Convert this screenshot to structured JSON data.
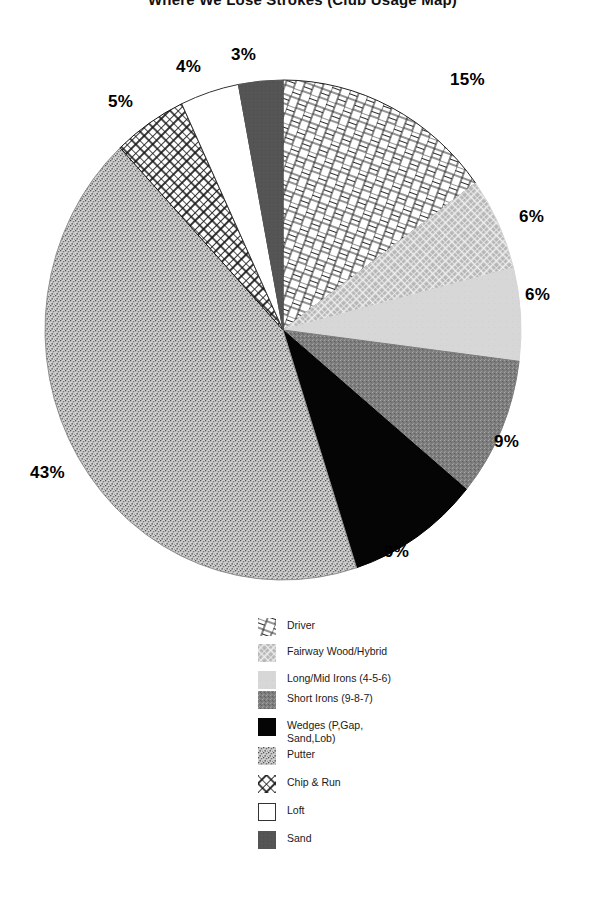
{
  "chart_data": {
    "type": "pie",
    "title": "Where We Lose Strokes (Club Usage Map)",
    "labels": [
      "Driver",
      "Fairway Wood/Hybrid",
      "Long/Mid Irons (4-5-6)",
      "Short Irons (9-8-7)",
      "Wedges (P,Gap, Sand,Lob)",
      "Putter",
      "Chip & Run",
      "Loft",
      "Sand"
    ],
    "values": [
      15,
      6,
      6,
      9,
      9,
      43,
      5,
      4,
      3
    ],
    "value_labels": [
      "15%",
      "6%",
      "6%",
      "9%",
      "9%",
      "43%",
      "5%",
      "4%",
      "3%"
    ],
    "start_angle_deg": 0,
    "direction": "clockwise",
    "legend_position": "bottom-center",
    "grid": false,
    "xlabel": "",
    "ylabel": "",
    "slice_fills": [
      {
        "name": "Driver",
        "pattern": "brick-herringbone",
        "color": "#ffffff",
        "stroke": "#222222"
      },
      {
        "name": "Fairway Wood/Hybrid",
        "pattern": "diagonal-crosshatch-gray",
        "color": "#b0b0b0",
        "stroke": "#d8d8d8"
      },
      {
        "name": "Long/Mid Irons (4-5-6)",
        "pattern": "solid-light-gray",
        "color": "#d6d6d6",
        "stroke": "#d6d6d6"
      },
      {
        "name": "Short Irons (9-8-7)",
        "pattern": "fine-noise-mid-gray",
        "color": "#7d7d7d",
        "stroke": "#7d7d7d"
      },
      {
        "name": "Wedges (P,Gap, Sand,Lob)",
        "pattern": "solid-black",
        "color": "#000000",
        "stroke": "#000000"
      },
      {
        "name": "Putter",
        "pattern": "coarse-speckle-gray",
        "color": "#a9a9a9",
        "stroke": "#8e8e8e"
      },
      {
        "name": "Chip & Run",
        "pattern": "x-crosshatch-black",
        "color": "#ffffff",
        "stroke": "#111111"
      },
      {
        "name": "Loft",
        "pattern": "solid-white",
        "color": "#ffffff",
        "stroke": "#333333"
      },
      {
        "name": "Sand",
        "pattern": "solid-dark-gray",
        "color": "#555555",
        "stroke": "#555555"
      }
    ]
  },
  "legend": {
    "items": [
      {
        "label": "Driver",
        "swatch": "driver-swatch"
      },
      {
        "label": "Fairway Wood/Hybrid",
        "swatch": "fairway-wood-swatch"
      },
      {
        "label": "Long/Mid Irons (4-5-6)",
        "swatch": "long-mid-irons-swatch"
      },
      {
        "label": "Short Irons (9-8-7)",
        "swatch": "short-irons-swatch"
      },
      {
        "label": "Wedges (P,Gap, Sand,Lob)",
        "swatch": "wedges-swatch"
      },
      {
        "label": "Putter",
        "swatch": "putter-swatch"
      },
      {
        "label": "Chip & Run",
        "swatch": "chip-and-run-swatch"
      },
      {
        "label": "Loft",
        "swatch": "loft-swatch"
      },
      {
        "label": "Sand",
        "swatch": "sand-swatch"
      }
    ]
  },
  "labels_positions": {
    "driver": "15%",
    "fairway": "6%",
    "longmid": "6%",
    "shortirons": "9%",
    "wedges": "9%",
    "putter": "43%",
    "chiprun": "5%",
    "loft": "4%",
    "sand": "3%"
  }
}
